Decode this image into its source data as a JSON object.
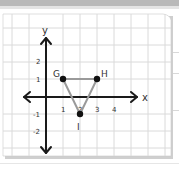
{
  "figure": {
    "type": "coordinate-plane",
    "axes": {
      "x_label": "x",
      "y_label": "y",
      "x_ticks": [
        "1",
        "2",
        "3",
        "4"
      ],
      "y_ticks": [
        "2",
        "1",
        "-1",
        "-2"
      ]
    },
    "points": [
      {
        "name": "G",
        "x": 1,
        "y": 1
      },
      {
        "name": "H",
        "x": 3,
        "y": 1
      },
      {
        "name": "I",
        "x": 2,
        "y": -1
      }
    ],
    "shape": "triangle GHI",
    "colors": {
      "axis": "#1a1a1a",
      "grid": "#d9d9d9",
      "triangle": "#9a9a9a",
      "point": "#111111",
      "paper": "#ffffff",
      "topbar": "#b9b9b9"
    }
  }
}
